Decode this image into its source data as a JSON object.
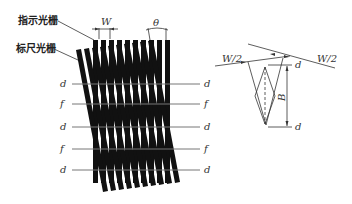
{
  "diagram": {
    "labels": {
      "indicator_grating": "指示光栅",
      "scale_grating": "标尺光栅",
      "W": "W",
      "theta": "θ",
      "W_half_left": "W/2",
      "W_half_right": "W/2",
      "B": "B",
      "d_top_right": "d",
      "d_bottom_right": "d"
    },
    "fringe_rows": [
      {
        "left": "d",
        "right": "d",
        "y": 84
      },
      {
        "left": "f",
        "right": "f",
        "y": 104
      },
      {
        "left": "d",
        "right": "d",
        "y": 127
      },
      {
        "left": "f",
        "right": "f",
        "y": 149
      },
      {
        "left": "d",
        "right": "d",
        "y": 170
      }
    ],
    "colors": {
      "bars": "#111111",
      "lines": "#777777"
    }
  }
}
